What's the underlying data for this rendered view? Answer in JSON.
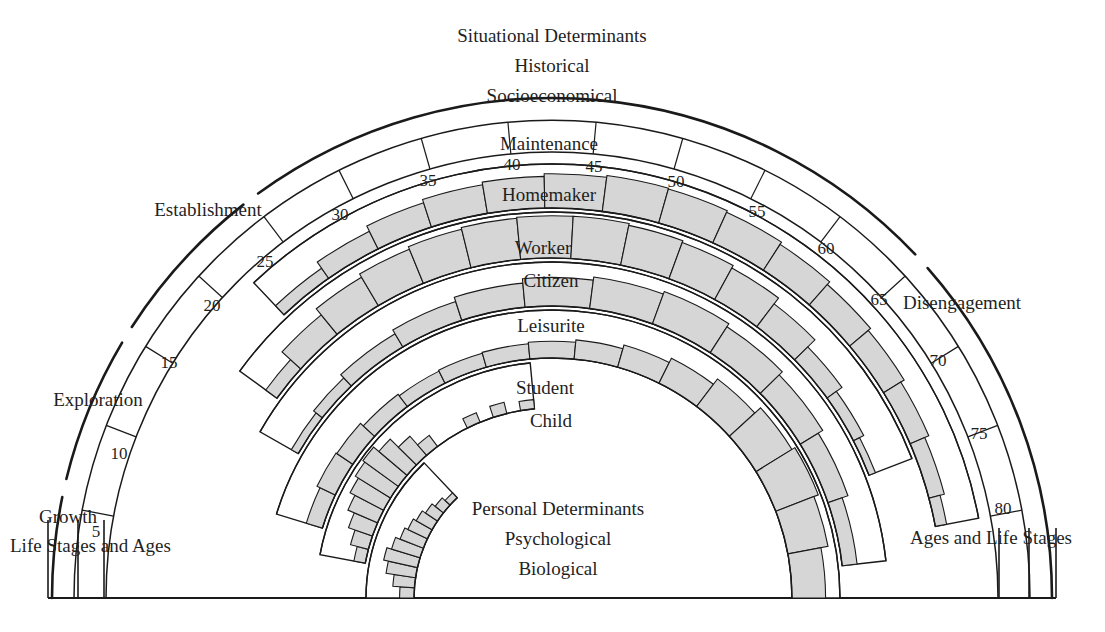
{
  "figure": {
    "kind": "life-career-rainbow",
    "top_caption": [
      "Situational Determinants",
      "Historical",
      "Socioeconomical"
    ],
    "center_caption": [
      "Personal Determinants",
      "Psychological",
      "Biological"
    ],
    "axis_label_left": "Life Stages and Ages",
    "axis_label_right": "Ages and Life Stages",
    "colors": {
      "band_fill": "#d6d6d6",
      "stroke": "#1a1a1a",
      "background": "#ffffff",
      "text": "#1f1f1f"
    }
  },
  "life_stages": [
    {
      "name": "Growth",
      "x": 68,
      "y": 506
    },
    {
      "name": "Exploration",
      "x": 98,
      "y": 389
    },
    {
      "name": "Establishment",
      "x": 208,
      "y": 199
    },
    {
      "name": "Maintenance",
      "x": 549,
      "y": 133
    },
    {
      "name": "Disengagement",
      "x": 962,
      "y": 292
    }
  ],
  "age_ticks": [
    {
      "label": "5",
      "x": 96,
      "y": 522
    },
    {
      "label": "10",
      "x": 119,
      "y": 444
    },
    {
      "label": "15",
      "x": 169,
      "y": 353
    },
    {
      "label": "20",
      "x": 212,
      "y": 296
    },
    {
      "label": "25",
      "x": 265,
      "y": 252
    },
    {
      "label": "30",
      "x": 340,
      "y": 205
    },
    {
      "label": "35",
      "x": 428,
      "y": 171
    },
    {
      "label": "40",
      "x": 512,
      "y": 155
    },
    {
      "label": "45",
      "x": 594,
      "y": 157
    },
    {
      "label": "50",
      "x": 676,
      "y": 172
    },
    {
      "label": "55",
      "x": 757,
      "y": 202
    },
    {
      "label": "60",
      "x": 826,
      "y": 239
    },
    {
      "label": "65",
      "x": 879,
      "y": 290
    },
    {
      "label": "70",
      "x": 938,
      "y": 351
    },
    {
      "label": "75",
      "x": 979,
      "y": 424
    },
    {
      "label": "80",
      "x": 1003,
      "y": 499
    }
  ],
  "roles": [
    {
      "name": "Homemaker",
      "x": 549,
      "y": 184
    },
    {
      "name": "Worker",
      "x": 543,
      "y": 237
    },
    {
      "name": "Citizen",
      "x": 551,
      "y": 270
    },
    {
      "name": "Leisurite",
      "x": 551,
      "y": 315
    },
    {
      "name": "Student",
      "x": 545,
      "y": 377
    },
    {
      "name": "Child",
      "x": 551,
      "y": 410
    }
  ],
  "chart_data": {
    "type": "area",
    "x": "age",
    "xlim": [
      0,
      85
    ],
    "categories": [
      "Child",
      "Student",
      "Leisurite",
      "Citizen",
      "Worker",
      "Homemaker"
    ],
    "series": [
      {
        "name": "Child",
        "span": [
          0,
          22
        ],
        "peak_age": 6
      },
      {
        "name": "Student",
        "span": [
          5,
          40
        ],
        "peak_age": 18
      },
      {
        "name": "Leisurite",
        "span": [
          8,
          85
        ],
        "peak_age": 68
      },
      {
        "name": "Citizen",
        "span": [
          14,
          82
        ],
        "peak_age": 55
      },
      {
        "name": "Worker",
        "span": [
          17,
          75
        ],
        "peak_age": 45
      },
      {
        "name": "Homemaker",
        "span": [
          22,
          80
        ],
        "peak_age": 50
      }
    ]
  }
}
